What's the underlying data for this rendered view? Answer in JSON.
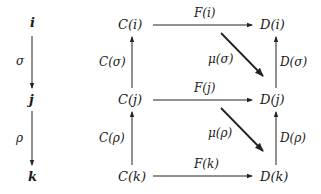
{
  "diagram": {
    "index_objects": {
      "i": "i",
      "j": "j",
      "k": "k"
    },
    "index_arrows": {
      "sigma": "σ",
      "rho": "ρ"
    },
    "C_objects": {
      "i": "C(i)",
      "j": "C(j)",
      "k": "C(k)"
    },
    "C_arrows": {
      "sigma": "C(σ)",
      "rho": "C(ρ)"
    },
    "D_objects": {
      "i": "D(i)",
      "j": "D(j)",
      "k": "D(k)"
    },
    "D_arrows": {
      "sigma": "D(σ)",
      "rho": "D(ρ)"
    },
    "F_arrows": {
      "i": "F(i)",
      "j": "F(j)",
      "k": "F(k)"
    },
    "mu_arrows": {
      "sigma": "μ(σ)",
      "rho": "μ(ρ)"
    }
  }
}
